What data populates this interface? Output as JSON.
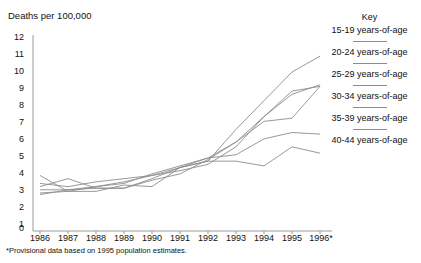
{
  "chart_data": {
    "type": "line",
    "title": "",
    "ylabel": "Deaths per 100,000",
    "xlabel": "",
    "categories": [
      "1986",
      "1987",
      "1988",
      "1989",
      "1990",
      "1991",
      "1992",
      "1993",
      "1994",
      "1995",
      "1996*"
    ],
    "x_tick_labels": [
      "1986",
      "1987",
      "1988",
      "1989",
      "1990",
      "1991",
      "1992",
      "1993",
      "1994",
      "1995",
      "1996*"
    ],
    "y_tick_labels": [
      "0",
      "1",
      "2",
      "3",
      "4",
      "5",
      "6",
      "7",
      "8",
      "9",
      "10",
      "11",
      "12"
    ],
    "ylim": [
      0,
      12
    ],
    "xlim": [
      1986,
      1996
    ],
    "grid": false,
    "legend_position": "right",
    "legend_title": "Key",
    "footnote": "*Provisional data based on 1995 population estimates.",
    "series": [
      {
        "name": "15-19 years-of-age",
        "values": [
          2.1,
          2.4,
          2.5,
          2.5,
          3.1,
          3.8,
          4.2,
          6.2,
          8.0,
          9.8,
          10.8
        ]
      },
      {
        "name": "20-24 years-of-age",
        "values": [
          2.8,
          2.6,
          2.9,
          3.1,
          3.3,
          3.6,
          4.0,
          5.1,
          7.0,
          8.4,
          9.0
        ]
      },
      {
        "name": "25-29 years-of-age",
        "values": [
          2.2,
          2.3,
          2.6,
          2.9,
          3.3,
          3.8,
          4.4,
          5.4,
          7.0,
          8.6,
          8.9
        ]
      },
      {
        "name": "30-34 years-of-age",
        "values": [
          2.6,
          3.1,
          2.5,
          2.5,
          3.0,
          3.4,
          4.3,
          5.4,
          6.7,
          6.9,
          8.9
        ]
      },
      {
        "name": "35-39 years-of-age",
        "values": [
          2.4,
          2.4,
          2.6,
          2.8,
          3.4,
          3.9,
          4.4,
          4.6,
          5.6,
          6.0,
          5.9
        ]
      },
      {
        "name": "40-44 years-of-age",
        "values": [
          3.3,
          2.3,
          2.3,
          2.7,
          2.6,
          3.8,
          4.2,
          4.2,
          3.9,
          5.1,
          4.7
        ]
      }
    ],
    "line_color": "#8d8d8d",
    "axis_color": "#9a9a9a"
  },
  "legend": {
    "title": "Key",
    "entries": [
      {
        "label": "15-19 years-of-age"
      },
      {
        "label": "20-24 years-of-age"
      },
      {
        "label": "25-29 years-of-age"
      },
      {
        "label": "30-34 years-of-age"
      },
      {
        "label": "35-39 years-of-age"
      },
      {
        "label": "40-44 years-of-age"
      }
    ]
  },
  "axes": {
    "y_title": "Deaths per 100,000"
  },
  "footnote": {
    "text": "*Provisional data based on 1995 population estimates."
  }
}
